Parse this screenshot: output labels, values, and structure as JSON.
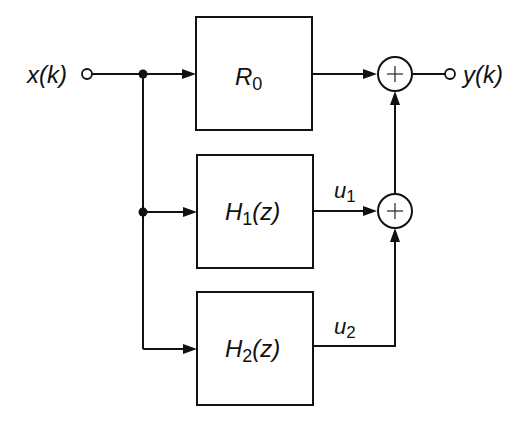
{
  "diagram": {
    "input": {
      "label": "x(k)"
    },
    "output": {
      "label": "y(k)"
    },
    "blocks": [
      {
        "id": "R0",
        "main": "R",
        "sub": "0",
        "suffix": ""
      },
      {
        "id": "H1",
        "main": "H",
        "sub": "1",
        "suffix": "(z)"
      },
      {
        "id": "H2",
        "main": "H",
        "sub": "2",
        "suffix": "(z)"
      }
    ],
    "signals": [
      {
        "id": "u1",
        "main": "u",
        "sub": "1"
      },
      {
        "id": "u2",
        "main": "u",
        "sub": "2"
      }
    ],
    "summers": [
      {
        "id": "sum-top",
        "symbol": "+"
      },
      {
        "id": "sum-bottom",
        "symbol": "+"
      }
    ]
  }
}
